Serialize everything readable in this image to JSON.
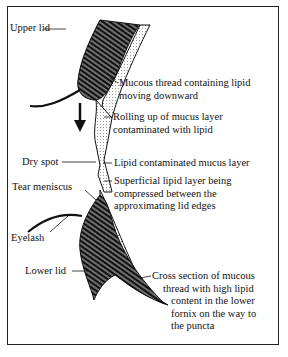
{
  "diagram": {
    "type": "anatomical-cross-section",
    "labels": {
      "upper_lid": "Upper lid",
      "mucous_thread": [
        "Mucous thread containing lipid",
        "moving downward"
      ],
      "rolling_up": [
        "Rolling up of mucus layer",
        "contaminated with lipid"
      ],
      "dry_spot": "Dry spot",
      "lipid_mucus_layer": "Lipid contaminated mucus layer",
      "tear_meniscus": "Tear meniscus",
      "superficial_lipid": [
        "Superficial lipid layer being",
        "compressed between the",
        "approximating lid edges"
      ],
      "eyelash": "Eyelash",
      "lower_lid": "Lower lid",
      "cross_section": [
        "Cross section of mucous",
        "thread with high lipid",
        "content in the lower",
        "fornix on the way to",
        "the puncta"
      ]
    },
    "colors": {
      "ink": "#111111",
      "paper": "#ffffff",
      "border": "#222222"
    }
  }
}
